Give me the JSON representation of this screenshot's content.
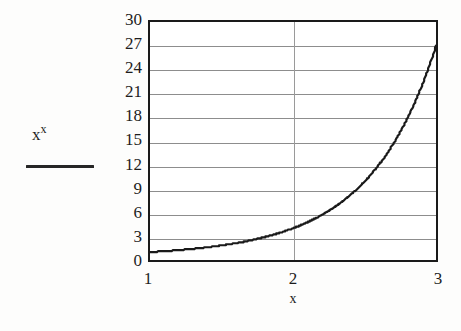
{
  "figure": {
    "background_color": "#fdfdfc",
    "plot_background_color": "#ffffff",
    "frame_color": "#1a1a1a",
    "grid_color": "#8d8d8d",
    "curve_color": "#1a1a1a"
  },
  "legend": {
    "base": "x",
    "exponent": "x",
    "swatch_name": "line-swatch"
  },
  "axis": {
    "x_title": "x",
    "y_title": ""
  },
  "chart_data": {
    "type": "line",
    "title": "",
    "subtitle": "",
    "xlabel": "x",
    "ylabel": "",
    "xlim": [
      1,
      3
    ],
    "ylim": [
      0,
      30
    ],
    "grid": true,
    "grid_axes": "both",
    "legend_position": "left-outside",
    "x_ticks": [
      1,
      2,
      3
    ],
    "x_tick_labels": [
      "1",
      "2",
      "3"
    ],
    "y_ticks": [
      0,
      3,
      6,
      9,
      12,
      15,
      18,
      21,
      24,
      27,
      30
    ],
    "y_tick_labels": [
      "0",
      "3",
      "6",
      "9",
      "12",
      "15",
      "18",
      "21",
      "24",
      "27",
      "30"
    ],
    "series": [
      {
        "name": "x^x",
        "formula": "y = x^x",
        "color": "#1a1a1a",
        "line_width": 2,
        "style": "solid",
        "x": [
          1.0,
          1.05,
          1.1,
          1.15,
          1.2,
          1.25,
          1.3,
          1.35,
          1.4,
          1.45,
          1.5,
          1.55,
          1.6,
          1.65,
          1.7,
          1.75,
          1.8,
          1.85,
          1.9,
          1.95,
          2.0,
          2.05,
          2.1,
          2.15,
          2.2,
          2.25,
          2.3,
          2.35,
          2.4,
          2.45,
          2.5,
          2.55,
          2.6,
          2.65,
          2.7,
          2.75,
          2.8,
          2.85,
          2.9,
          2.95,
          3.0
        ],
        "values": [
          1.0,
          1.05,
          1.11,
          1.18,
          1.25,
          1.32,
          1.41,
          1.5,
          1.6,
          1.71,
          1.84,
          1.97,
          2.12,
          2.29,
          2.47,
          2.68,
          2.91,
          3.17,
          3.45,
          3.77,
          4.0,
          4.52,
          4.96,
          5.45,
          6.0,
          6.61,
          7.29,
          8.06,
          8.92,
          9.88,
          10.96,
          12.18,
          13.54,
          15.08,
          16.81,
          18.76,
          20.96,
          23.43,
          26.22,
          29.36,
          27.0
        ]
      }
    ],
    "annotations": []
  }
}
